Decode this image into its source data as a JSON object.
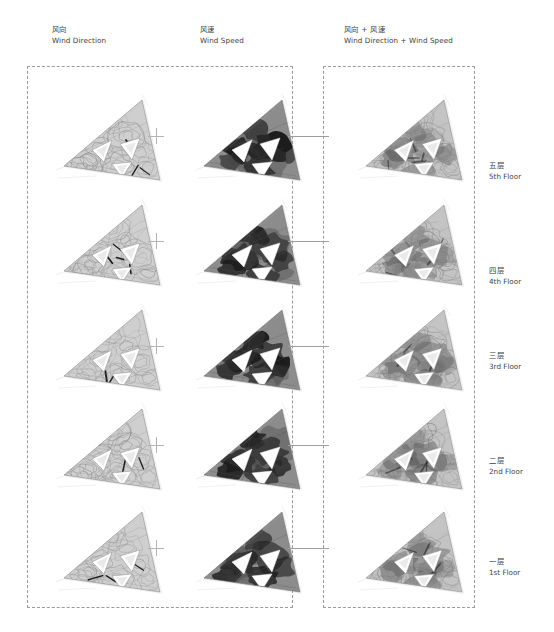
{
  "page": {
    "background_color": "#ffffff",
    "width": 554,
    "height": 632
  },
  "columns": [
    {
      "id": "wind-direction",
      "label_cn": "风向",
      "label_en": "Wind Direction",
      "x": 52,
      "y": 24
    },
    {
      "id": "wind-speed",
      "label_cn": "风速",
      "label_en": "Wind Speed",
      "x": 200,
      "y": 24
    },
    {
      "id": "wind-direction-plus-speed",
      "label_cn": "风向 + 风速",
      "label_en": "Wind Direction + Wind Speed",
      "x": 344,
      "y": 24
    }
  ],
  "operators": {
    "plus_symbol": "+",
    "plus_color": "#b4b4b4",
    "connector_color": "#9e9e9e"
  },
  "frames": [
    {
      "id": "frame-left",
      "name": "inputs-frame",
      "style": "dashed",
      "color": "#9a9a9a"
    },
    {
      "id": "frame-right",
      "name": "results-frame",
      "style": "dashed",
      "color": "#9a9a9a"
    }
  ],
  "floors": [
    {
      "id": "floor-5",
      "label_cn": "五层",
      "label_en": "5th Floor",
      "row": 0,
      "y": 88,
      "label_y": 160
    },
    {
      "id": "floor-4",
      "label_cn": "四层",
      "label_en": "4th Floor",
      "row": 1,
      "y": 193,
      "label_y": 265
    },
    {
      "id": "floor-3",
      "label_cn": "三层",
      "label_en": "3rd Floor",
      "row": 2,
      "y": 298,
      "label_y": 350
    },
    {
      "id": "floor-2",
      "label_cn": "二层",
      "label_en": "2nd Floor",
      "row": 3,
      "y": 397,
      "label_y": 455
    },
    {
      "id": "floor-1",
      "label_cn": "一层",
      "label_en": "1st Floor",
      "row": 4,
      "y": 500,
      "label_y": 556
    }
  ],
  "diagram": {
    "shape": "triangular-floor-plan",
    "columns_x": [
      56,
      196,
      358
    ],
    "palette": {
      "wind_direction_fill": "#cfcfcf",
      "wind_direction_stroke": "#8d8d8d",
      "wind_speed_fill": "#8c8c8c",
      "wind_speed_dark": "#1c1c1c",
      "wind_speed_void": "#ffffff",
      "combined_fill": "#c4c4c4",
      "combined_stroke": "#7e7e7e",
      "outline": "#b0b0b0"
    }
  },
  "chart_data": {
    "type": "heatmap",
    "title": "Wind Direction + Wind Speed",
    "rows": [
      "5th Floor",
      "4th Floor",
      "3rd Floor",
      "2nd Floor",
      "1st Floor"
    ],
    "columns": [
      "Wind Direction",
      "Wind Speed",
      "Wind Direction + Wind Speed"
    ],
    "note": "Each cell is a triangular plan CFD visualization; left column shows streamline contours, middle column shows wind-speed intensity (dark = high), right column overlays both.",
    "legend_position": "none",
    "grid": false
  }
}
